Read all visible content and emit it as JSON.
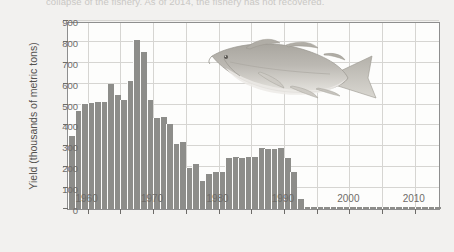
{
  "caption": "collapse of the fishery. As of 2014, the fishery has not recovered.",
  "axis": {
    "y_label": "Yield (thousands of metric tons)",
    "y_ticks": [
      0,
      100,
      200,
      300,
      400,
      500,
      600,
      700,
      800,
      900
    ],
    "x_ticks": [
      1960,
      1970,
      1980,
      1990,
      2000,
      2010
    ]
  },
  "illustration": {
    "name": "atlantic-cod-fish",
    "body_color": "#b9b6b0",
    "belly_color": "#e3e1dc"
  },
  "colors": {
    "bar": "#8d8d8a",
    "grid": "#d6d5d2",
    "frame": "#8e8e8e",
    "plot_background": "#fdfdfc",
    "page_background": "#f2f1ef",
    "tick_text": "#6e6c69"
  },
  "chart_data": {
    "type": "bar",
    "title": "",
    "subtitle": "",
    "xlabel": "",
    "ylabel": "Yield (thousands of metric tons)",
    "xlim": [
      1957,
      2014
    ],
    "ylim": [
      0,
      900
    ],
    "grid": true,
    "legend": false,
    "x": [
      1957,
      1958,
      1959,
      1960,
      1961,
      1962,
      1963,
      1964,
      1965,
      1966,
      1967,
      1968,
      1969,
      1970,
      1971,
      1972,
      1973,
      1974,
      1975,
      1976,
      1977,
      1978,
      1979,
      1980,
      1981,
      1982,
      1983,
      1984,
      1985,
      1986,
      1987,
      1988,
      1989,
      1990,
      1991,
      1992,
      1993,
      1994,
      1995,
      1996,
      1997,
      1998,
      1999,
      2000,
      2001,
      2002,
      2003,
      2004,
      2005,
      2006,
      2007,
      2008,
      2009,
      2010,
      2011,
      2012,
      2013
    ],
    "values": [
      350,
      470,
      505,
      508,
      510,
      510,
      600,
      548,
      523,
      615,
      810,
      750,
      520,
      435,
      440,
      405,
      310,
      320,
      195,
      215,
      135,
      170,
      175,
      175,
      245,
      250,
      245,
      250,
      250,
      290,
      285,
      285,
      290,
      245,
      175,
      50,
      12,
      8,
      8,
      8,
      8,
      8,
      8,
      8,
      8,
      8,
      8,
      8,
      8,
      8,
      8,
      8,
      8,
      8,
      8,
      8,
      8
    ],
    "categories": [
      "1957",
      "1958",
      "1959",
      "1960",
      "1961",
      "1962",
      "1963",
      "1964",
      "1965",
      "1966",
      "1967",
      "1968",
      "1969",
      "1970",
      "1971",
      "1972",
      "1973",
      "1974",
      "1975",
      "1976",
      "1977",
      "1978",
      "1979",
      "1980",
      "1981",
      "1982",
      "1983",
      "1984",
      "1985",
      "1986",
      "1987",
      "1988",
      "1989",
      "1990",
      "1991",
      "1992",
      "1993",
      "1994",
      "1995",
      "1996",
      "1997",
      "1998",
      "1999",
      "2000",
      "2001",
      "2002",
      "2003",
      "2004",
      "2005",
      "2006",
      "2007",
      "2008",
      "2009",
      "2010",
      "2011",
      "2012",
      "2013"
    ]
  }
}
